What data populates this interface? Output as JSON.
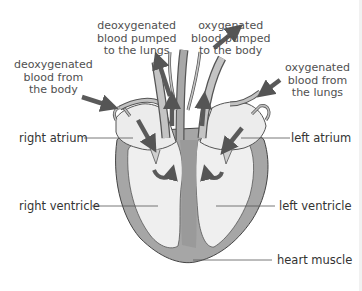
{
  "diagram": {
    "colors": {
      "muscle": "#a8a8a8",
      "muscle_dark": "#8e8e8e",
      "chamber": "#eeeeee",
      "vessel": "#b9b9b9",
      "arrow": "#555555",
      "label_line": "#555555",
      "text": "#333333"
    },
    "flow_labels": {
      "deoxy_from_body": [
        "deoxygenated",
        "blood from",
        "the body"
      ],
      "deoxy_to_lungs": [
        "deoxygenated",
        "blood pumped",
        "to the lungs"
      ],
      "oxy_to_body": [
        "oxygenated",
        "blood pumped",
        "to the body"
      ],
      "oxy_from_lungs": [
        "oxygenated",
        "blood from",
        "the lungs"
      ]
    },
    "part_labels": {
      "right_atrium": "right atrium",
      "left_atrium": "left atrium",
      "right_ventricle": "right ventricle",
      "left_ventricle": "left ventricle",
      "heart_muscle": "heart muscle"
    }
  }
}
